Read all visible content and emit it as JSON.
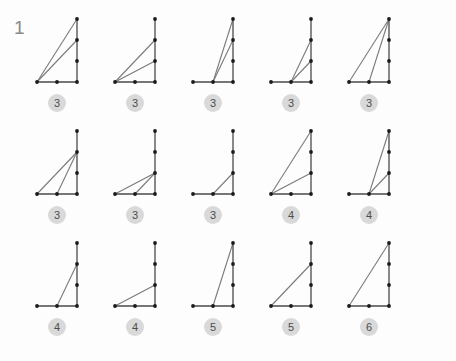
{
  "page": {
    "problem_number": "1",
    "background_color": "#fdfdfd",
    "line_color": "#7a7a7a",
    "axis_color": "#4a4a4a",
    "dot_color": "#1a1a1a",
    "badge_bg_color": "#d9d9d9",
    "badge_text_color": "#4d4d4d",
    "number_color": "#8a8a8a"
  },
  "geometry": {
    "description": "Each figure is drawn on a lattice: a vertical segment on the right at x=2 with dots at y=0,1,2,3 and a horizontal segment along the bottom at y=0 with dots at x=0,1,2. Diagonal chords connect lattice points.",
    "x_values": [
      0,
      1,
      2
    ],
    "y_values": [
      0,
      1,
      2,
      3
    ]
  },
  "figures": [
    {
      "id": "fig-r1c1",
      "row": 1,
      "col": 1,
      "count_label": "3",
      "dots": [
        [
          2,
          3
        ],
        [
          2,
          2
        ],
        [
          2,
          1
        ],
        [
          0,
          0
        ],
        [
          1,
          0
        ],
        [
          2,
          0
        ]
      ],
      "axes": [
        [
          [
            2,
            0
          ],
          [
            2,
            3
          ]
        ],
        [
          [
            0,
            0
          ],
          [
            2,
            0
          ]
        ]
      ],
      "chords": [
        [
          [
            0,
            0
          ],
          [
            2,
            3
          ]
        ],
        [
          [
            0,
            0
          ],
          [
            2,
            2
          ]
        ]
      ]
    },
    {
      "id": "fig-r1c2",
      "row": 1,
      "col": 2,
      "count_label": "3",
      "dots": [
        [
          2,
          3
        ],
        [
          2,
          2
        ],
        [
          2,
          1
        ],
        [
          0,
          0
        ],
        [
          1,
          0
        ],
        [
          2,
          0
        ]
      ],
      "axes": [
        [
          [
            2,
            0
          ],
          [
            2,
            3
          ]
        ],
        [
          [
            0,
            0
          ],
          [
            2,
            0
          ]
        ]
      ],
      "chords": [
        [
          [
            0,
            0
          ],
          [
            2,
            2
          ]
        ],
        [
          [
            0,
            0
          ],
          [
            2,
            1
          ]
        ]
      ]
    },
    {
      "id": "fig-r1c3",
      "row": 1,
      "col": 3,
      "count_label": "3",
      "dots": [
        [
          2,
          3
        ],
        [
          2,
          2
        ],
        [
          2,
          1
        ],
        [
          0,
          0
        ],
        [
          1,
          0
        ],
        [
          2,
          0
        ]
      ],
      "axes": [
        [
          [
            2,
            0
          ],
          [
            2,
            3
          ]
        ],
        [
          [
            0,
            0
          ],
          [
            2,
            0
          ]
        ]
      ],
      "chords": [
        [
          [
            1,
            0
          ],
          [
            2,
            3
          ]
        ],
        [
          [
            1,
            0
          ],
          [
            2,
            2
          ]
        ]
      ]
    },
    {
      "id": "fig-r1c4",
      "row": 1,
      "col": 4,
      "count_label": "3",
      "dots": [
        [
          2,
          3
        ],
        [
          2,
          2
        ],
        [
          2,
          1
        ],
        [
          0,
          0
        ],
        [
          1,
          0
        ],
        [
          2,
          0
        ]
      ],
      "axes": [
        [
          [
            2,
            0
          ],
          [
            2,
            3
          ]
        ],
        [
          [
            0,
            0
          ],
          [
            2,
            0
          ]
        ]
      ],
      "chords": [
        [
          [
            1,
            0
          ],
          [
            2,
            2
          ]
        ],
        [
          [
            1,
            0
          ],
          [
            2,
            1
          ]
        ]
      ]
    },
    {
      "id": "fig-r1c5",
      "row": 1,
      "col": 5,
      "count_label": "3",
      "dots": [
        [
          2,
          3
        ],
        [
          2,
          2
        ],
        [
          2,
          1
        ],
        [
          0,
          0
        ],
        [
          1,
          0
        ],
        [
          2,
          0
        ]
      ],
      "axes": [
        [
          [
            2,
            0
          ],
          [
            2,
            3
          ]
        ],
        [
          [
            0,
            0
          ],
          [
            2,
            0
          ]
        ]
      ],
      "chords": [
        [
          [
            0,
            0
          ],
          [
            2,
            3
          ]
        ],
        [
          [
            1,
            0
          ],
          [
            2,
            3
          ]
        ]
      ]
    },
    {
      "id": "fig-r2c1",
      "row": 2,
      "col": 1,
      "count_label": "3",
      "dots": [
        [
          2,
          3
        ],
        [
          2,
          2
        ],
        [
          2,
          1
        ],
        [
          0,
          0
        ],
        [
          1,
          0
        ],
        [
          2,
          0
        ]
      ],
      "axes": [
        [
          [
            2,
            0
          ],
          [
            2,
            3
          ]
        ],
        [
          [
            0,
            0
          ],
          [
            2,
            0
          ]
        ]
      ],
      "chords": [
        [
          [
            0,
            0
          ],
          [
            2,
            2
          ]
        ],
        [
          [
            1,
            0
          ],
          [
            2,
            2
          ]
        ]
      ]
    },
    {
      "id": "fig-r2c2",
      "row": 2,
      "col": 2,
      "count_label": "3",
      "dots": [
        [
          2,
          3
        ],
        [
          2,
          2
        ],
        [
          2,
          1
        ],
        [
          0,
          0
        ],
        [
          1,
          0
        ],
        [
          2,
          0
        ]
      ],
      "axes": [
        [
          [
            2,
            0
          ],
          [
            2,
            3
          ]
        ],
        [
          [
            0,
            0
          ],
          [
            2,
            0
          ]
        ]
      ],
      "chords": [
        [
          [
            0,
            0
          ],
          [
            2,
            1
          ]
        ],
        [
          [
            1,
            0
          ],
          [
            2,
            1
          ]
        ]
      ]
    },
    {
      "id": "fig-r2c3",
      "row": 2,
      "col": 3,
      "count_label": "3",
      "dots": [
        [
          2,
          3
        ],
        [
          2,
          2
        ],
        [
          2,
          1
        ],
        [
          0,
          0
        ],
        [
          1,
          0
        ],
        [
          2,
          0
        ]
      ],
      "axes": [
        [
          [
            2,
            0
          ],
          [
            2,
            3
          ]
        ],
        [
          [
            0,
            0
          ],
          [
            2,
            0
          ]
        ]
      ],
      "chords": [
        [
          [
            1,
            0
          ],
          [
            2,
            1
          ]
        ]
      ]
    },
    {
      "id": "fig-r2c4",
      "row": 2,
      "col": 4,
      "count_label": "4",
      "dots": [
        [
          2,
          3
        ],
        [
          2,
          2
        ],
        [
          2,
          1
        ],
        [
          0,
          0
        ],
        [
          1,
          0
        ],
        [
          2,
          0
        ]
      ],
      "axes": [
        [
          [
            2,
            0
          ],
          [
            2,
            3
          ]
        ],
        [
          [
            0,
            0
          ],
          [
            2,
            0
          ]
        ]
      ],
      "chords": [
        [
          [
            0,
            0
          ],
          [
            2,
            3
          ]
        ],
        [
          [
            0,
            0
          ],
          [
            2,
            1
          ]
        ]
      ]
    },
    {
      "id": "fig-r2c5",
      "row": 2,
      "col": 5,
      "count_label": "4",
      "dots": [
        [
          2,
          3
        ],
        [
          2,
          2
        ],
        [
          2,
          1
        ],
        [
          0,
          0
        ],
        [
          1,
          0
        ],
        [
          2,
          0
        ]
      ],
      "axes": [
        [
          [
            2,
            0
          ],
          [
            2,
            3
          ]
        ],
        [
          [
            0,
            0
          ],
          [
            2,
            0
          ]
        ]
      ],
      "chords": [
        [
          [
            1,
            0
          ],
          [
            2,
            3
          ]
        ],
        [
          [
            1,
            0
          ],
          [
            2,
            1
          ]
        ]
      ]
    },
    {
      "id": "fig-r3c1",
      "row": 3,
      "col": 1,
      "count_label": "4",
      "dots": [
        [
          2,
          3
        ],
        [
          2,
          2
        ],
        [
          2,
          1
        ],
        [
          0,
          0
        ],
        [
          1,
          0
        ],
        [
          2,
          0
        ]
      ],
      "axes": [
        [
          [
            2,
            0
          ],
          [
            2,
            3
          ]
        ],
        [
          [
            0,
            0
          ],
          [
            2,
            0
          ]
        ]
      ],
      "chords": [
        [
          [
            1,
            0
          ],
          [
            2,
            2
          ]
        ]
      ]
    },
    {
      "id": "fig-r3c2",
      "row": 3,
      "col": 2,
      "count_label": "4",
      "dots": [
        [
          2,
          3
        ],
        [
          2,
          2
        ],
        [
          2,
          1
        ],
        [
          0,
          0
        ],
        [
          1,
          0
        ],
        [
          2,
          0
        ]
      ],
      "axes": [
        [
          [
            2,
            0
          ],
          [
            2,
            3
          ]
        ],
        [
          [
            0,
            0
          ],
          [
            2,
            0
          ]
        ]
      ],
      "chords": [
        [
          [
            0,
            0
          ],
          [
            2,
            1
          ]
        ]
      ]
    },
    {
      "id": "fig-r3c3",
      "row": 3,
      "col": 3,
      "count_label": "5",
      "dots": [
        [
          2,
          3
        ],
        [
          2,
          2
        ],
        [
          2,
          1
        ],
        [
          0,
          0
        ],
        [
          1,
          0
        ],
        [
          2,
          0
        ]
      ],
      "axes": [
        [
          [
            2,
            0
          ],
          [
            2,
            3
          ]
        ],
        [
          [
            0,
            0
          ],
          [
            2,
            0
          ]
        ]
      ],
      "chords": [
        [
          [
            1,
            0
          ],
          [
            2,
            3
          ]
        ]
      ]
    },
    {
      "id": "fig-r3c4",
      "row": 3,
      "col": 4,
      "count_label": "5",
      "dots": [
        [
          2,
          3
        ],
        [
          2,
          2
        ],
        [
          2,
          1
        ],
        [
          0,
          0
        ],
        [
          1,
          0
        ],
        [
          2,
          0
        ]
      ],
      "axes": [
        [
          [
            2,
            0
          ],
          [
            2,
            3
          ]
        ],
        [
          [
            0,
            0
          ],
          [
            2,
            0
          ]
        ]
      ],
      "chords": [
        [
          [
            0,
            0
          ],
          [
            2,
            2
          ]
        ]
      ]
    },
    {
      "id": "fig-r3c5",
      "row": 3,
      "col": 5,
      "count_label": "6",
      "dots": [
        [
          2,
          3
        ],
        [
          2,
          2
        ],
        [
          2,
          1
        ],
        [
          0,
          0
        ],
        [
          1,
          0
        ],
        [
          2,
          0
        ]
      ],
      "axes": [
        [
          [
            2,
            0
          ],
          [
            2,
            3
          ]
        ],
        [
          [
            0,
            0
          ],
          [
            2,
            0
          ]
        ]
      ],
      "chords": [
        [
          [
            0,
            0
          ],
          [
            2,
            3
          ]
        ]
      ]
    }
  ]
}
